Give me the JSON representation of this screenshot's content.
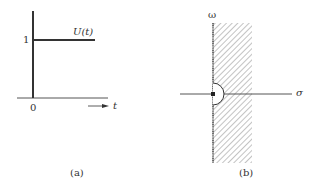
{
  "panel_a": {
    "caption": "(a)",
    "function_label": "U(t)",
    "y_tick": "1",
    "x_origin": "0",
    "x_axis_label": "t"
  },
  "panel_b": {
    "caption": "(b)",
    "vertical_axis_label": "ω",
    "horizontal_axis_label": "σ",
    "hatch_region": "right half-plane strip (Re s > 0)",
    "contour": "small semicircular indentation around origin"
  },
  "colors": {
    "line": "#333333",
    "hatch": "#9a9a9a",
    "background": "#ffffff"
  }
}
